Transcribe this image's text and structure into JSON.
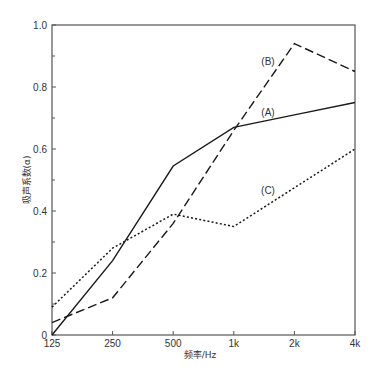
{
  "chart_data": {
    "type": "line",
    "title": "",
    "xlabel": "频率/Hz",
    "ylabel": "吸声系数(α)",
    "x_scale": "log2",
    "categories": [
      "125",
      "250",
      "500",
      "1k",
      "2k",
      "4k"
    ],
    "x_values_hz": [
      125,
      250,
      500,
      1000,
      2000,
      4000
    ],
    "ylim": [
      0,
      1.0
    ],
    "yticks": [
      0,
      0.2,
      0.4,
      0.6,
      0.8,
      1.0
    ],
    "ytick_labels": [
      "0",
      "0.2",
      "0.4",
      "0.6",
      "0.8",
      "1.0"
    ],
    "grid": false,
    "legend": "inline labels",
    "series": [
      {
        "name": "(A)",
        "style": "solid",
        "color": "#1a1a1a",
        "values": [
          0.0,
          0.24,
          0.545,
          0.67,
          0.71,
          0.75
        ]
      },
      {
        "name": "(B)",
        "style": "dashed",
        "color": "#1a1a1a",
        "values": [
          0.04,
          0.12,
          0.36,
          0.66,
          0.94,
          0.85
        ]
      },
      {
        "name": "(C)",
        "style": "dotted",
        "color": "#1a1a1a",
        "values": [
          0.09,
          0.28,
          0.39,
          0.35,
          0.475,
          0.6
        ]
      }
    ],
    "annotations": [
      {
        "text": "(A)",
        "x_cat": "2k",
        "y": 0.72
      },
      {
        "text": "(B)",
        "x_cat": "2k",
        "y": 0.88
      },
      {
        "text": "(C)",
        "x_cat": "2k",
        "y": 0.46
      }
    ]
  }
}
